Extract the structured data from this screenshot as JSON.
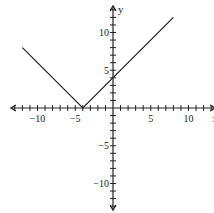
{
  "chart_data": {
    "type": "line",
    "title": "",
    "xlabel": "x",
    "ylabel": "y",
    "xlim": [
      -13,
      13
    ],
    "ylim": [
      -13,
      13
    ],
    "x_tick_step": 1,
    "y_tick_step": 1,
    "x_tick_labels": [
      {
        "value": -10,
        "label": "-10"
      },
      {
        "value": -5,
        "label": "-5"
      },
      {
        "value": 5,
        "label": "5"
      },
      {
        "value": 10,
        "label": "10"
      }
    ],
    "y_tick_labels": [
      {
        "value": 10,
        "label": "10"
      },
      {
        "value": 5,
        "label": "5"
      },
      {
        "value": -5,
        "label": "-5"
      },
      {
        "value": -10,
        "label": "-10"
      }
    ],
    "grid": false,
    "series": [
      {
        "name": "y = |x + 4|",
        "points": [
          [
            -12,
            8
          ],
          [
            -4,
            0
          ],
          [
            8,
            12
          ]
        ],
        "color": "#222222"
      }
    ]
  }
}
